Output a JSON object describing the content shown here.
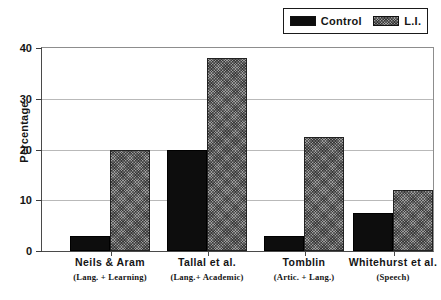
{
  "chart_data": {
    "type": "bar",
    "title": "",
    "xlabel": "",
    "ylabel": "Percentage",
    "ylim": [
      0,
      40
    ],
    "yticks": [
      0,
      10,
      20,
      30,
      40
    ],
    "ytick_labels": [
      "0",
      "10",
      "20",
      "30",
      "40"
    ],
    "grid": true,
    "legend_position": "top-right",
    "categories": [
      "Neils & Aram",
      "Tallal et al.",
      "Tomblin",
      "Whitehurst et al."
    ],
    "category_sublabels": [
      "(Lang. + Learning)",
      "(Lang.+ Academic)",
      "(Artic. + Lang.)",
      "(Speech)"
    ],
    "series": [
      {
        "name": "Control",
        "values": [
          3,
          20,
          3,
          7.5
        ],
        "color": "#0d0d0d",
        "pattern": "solid"
      },
      {
        "name": "L.I.",
        "values": [
          20,
          38,
          22.5,
          12
        ],
        "color": "#9c9c9c",
        "pattern": "cross-hatch"
      }
    ]
  },
  "legend": {
    "items": [
      {
        "label": "Control"
      },
      {
        "label": "L.I."
      }
    ]
  },
  "axis": {
    "y_title": "Percentage"
  }
}
